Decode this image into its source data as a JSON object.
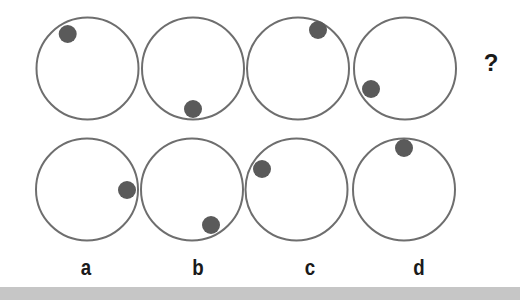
{
  "puzzle": {
    "question_mark": "?",
    "colors": {
      "circle_stroke": "#6e6e6e",
      "dot_fill": "#5a5a5a",
      "background": "#ffffff",
      "bottom_bar": "#c6c6c6",
      "label": "#1a1a1a"
    },
    "circle_radius": 51,
    "dot_radius": 9,
    "sequence": [
      {
        "cx": 87.5,
        "cy": 68.5,
        "dot": {
          "x": 67.7,
          "y": 34
        },
        "dot_position": "upper-left"
      },
      {
        "cx": 193,
        "cy": 68.5,
        "dot": {
          "x": 193,
          "y": 109
        },
        "dot_position": "bottom"
      },
      {
        "cx": 298,
        "cy": 68.5,
        "dot": {
          "x": 318,
          "y": 30
        },
        "dot_position": "upper-right"
      },
      {
        "cx": 405,
        "cy": 68.5,
        "dot": {
          "x": 371,
          "y": 89
        },
        "dot_position": "lower-left"
      }
    ],
    "options": [
      {
        "label": "a",
        "cx": 87,
        "cy": 189.5,
        "dot": {
          "x": 127,
          "y": 190
        },
        "dot_position": "right",
        "label_x": 86
      },
      {
        "label": "b",
        "cx": 192,
        "cy": 189.5,
        "dot": {
          "x": 211,
          "y": 225
        },
        "dot_position": "lower-right",
        "label_x": 198
      },
      {
        "label": "c",
        "cx": 296.5,
        "cy": 189.5,
        "dot": {
          "x": 262,
          "y": 169
        },
        "dot_position": "upper-left",
        "label_x": 310
      },
      {
        "label": "d",
        "cx": 404,
        "cy": 189.5,
        "dot": {
          "x": 404,
          "y": 148
        },
        "dot_position": "top",
        "label_x": 419
      }
    ]
  }
}
